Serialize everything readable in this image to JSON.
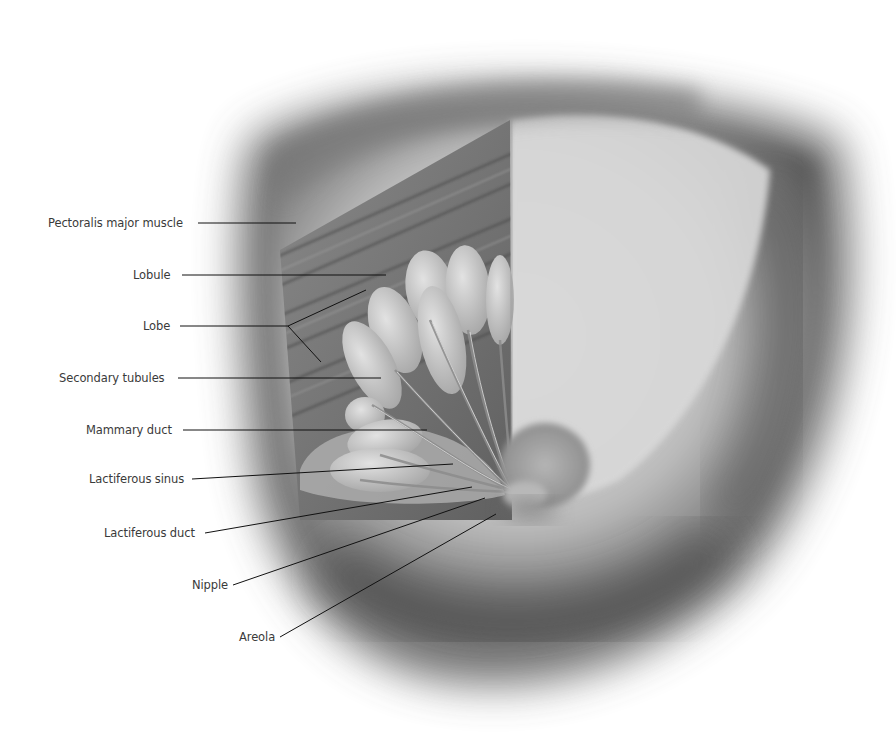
{
  "figure": {
    "palette": {
      "background": "#ffffff",
      "skin_light": "#d6d6d6",
      "skin_mid": "#a9a9a9",
      "shadow": "#4a4a4a",
      "muscle": "#707070",
      "gland": "#c9c9c9",
      "label_text": "#3a3a3a",
      "leader_line": "#111111"
    }
  },
  "labels": [
    {
      "id": "pectoralis",
      "text": "Pectoralis major muscle"
    },
    {
      "id": "lobule",
      "text": "Lobule"
    },
    {
      "id": "lobe",
      "text": "Lobe"
    },
    {
      "id": "secondary-tubules",
      "text": "Secondary tubules"
    },
    {
      "id": "mammary-duct",
      "text": "Mammary duct"
    },
    {
      "id": "lactiferous-sinus",
      "text": "Lactiferous sinus"
    },
    {
      "id": "lactiferous-duct",
      "text": "Lactiferous duct"
    },
    {
      "id": "nipple",
      "text": "Nipple"
    },
    {
      "id": "areola",
      "text": "Areola"
    }
  ]
}
